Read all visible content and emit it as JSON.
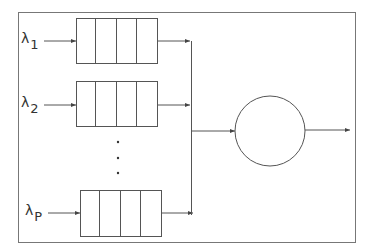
{
  "diagram": {
    "type": "queueing-system",
    "stroke_color": "#444444",
    "frame_color": "#666666",
    "queues": [
      {
        "symbol": "λ",
        "subscript": "1",
        "y": 41
      },
      {
        "symbol": "λ",
        "subscript": "2",
        "y": 105
      },
      {
        "symbol": "λ",
        "subscript": "P",
        "y": 213
      }
    ],
    "ellipsis": "⋮",
    "server": {
      "shape": "circle"
    }
  }
}
